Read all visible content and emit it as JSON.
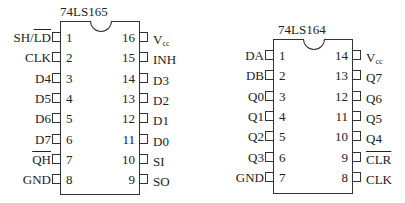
{
  "diagrams": [
    {
      "title": "74LS165",
      "left_pins": [
        {
          "num": "1",
          "label": "SH/",
          "label_overline": "LD"
        },
        {
          "num": "2",
          "label": "CLK"
        },
        {
          "num": "3",
          "label": "D4"
        },
        {
          "num": "4",
          "label": "D5"
        },
        {
          "num": "5",
          "label": "D6"
        },
        {
          "num": "6",
          "label": "D7"
        },
        {
          "num": "7",
          "label": "",
          "label_overline": "QH"
        },
        {
          "num": "8",
          "label": "GND"
        }
      ],
      "right_pins": [
        {
          "num": "16",
          "label": "V",
          "label_sub": "cc"
        },
        {
          "num": "15",
          "label": "INH"
        },
        {
          "num": "14",
          "label": "D3"
        },
        {
          "num": "13",
          "label": "D2"
        },
        {
          "num": "12",
          "label": "D1"
        },
        {
          "num": "11",
          "label": "D0"
        },
        {
          "num": "10",
          "label": "SI"
        },
        {
          "num": "9",
          "label": "SO"
        }
      ]
    },
    {
      "title": "74LS164",
      "left_pins": [
        {
          "num": "1",
          "label": "DA"
        },
        {
          "num": "2",
          "label": "DB"
        },
        {
          "num": "3",
          "label": "Q0"
        },
        {
          "num": "4",
          "label": "Q1"
        },
        {
          "num": "5",
          "label": "Q2"
        },
        {
          "num": "6",
          "label": "Q3"
        },
        {
          "num": "7",
          "label": "GND"
        }
      ],
      "right_pins": [
        {
          "num": "14",
          "label": "V",
          "label_sub": "cc"
        },
        {
          "num": "13",
          "label": "Q7"
        },
        {
          "num": "12",
          "label": "Q6"
        },
        {
          "num": "11",
          "label": "Q5"
        },
        {
          "num": "10",
          "label": "Q4"
        },
        {
          "num": "9",
          "label": "",
          "label_overline": "CLR"
        },
        {
          "num": "8",
          "label": "CLK"
        }
      ]
    }
  ]
}
